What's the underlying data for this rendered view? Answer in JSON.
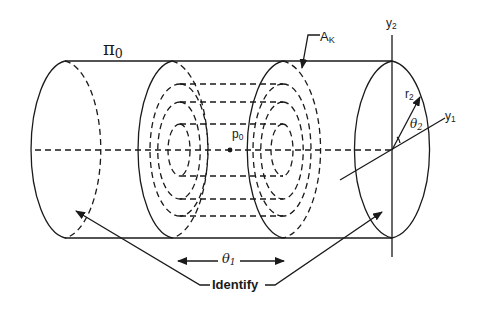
{
  "diagram": {
    "type": "cylinder-with-nested-tori",
    "colors": {
      "stroke": "#1a1a1a",
      "background": "#ffffff"
    },
    "labels": {
      "pi": "π",
      "pi_sub": "0",
      "a": "A",
      "a_sub": "K",
      "p": "p",
      "p_sub": "0",
      "y2": "y",
      "y2_sub": "2",
      "y1": "y",
      "y1_sub": "1",
      "r2": "r",
      "r2_sub": "2",
      "theta2": "θ",
      "theta2_sub": "2",
      "theta1": "θ",
      "theta1_sub": "1",
      "identify": "Identify"
    }
  }
}
